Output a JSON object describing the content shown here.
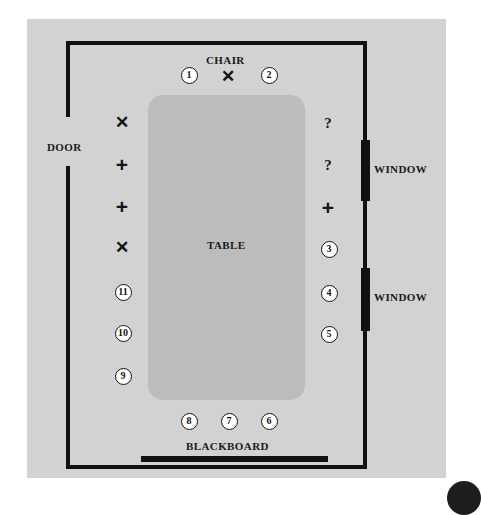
{
  "diagram": {
    "background_color": "#ffffff",
    "panel_color": "#d2d2d2",
    "ink_color": "#111111",
    "table_color": "#bcbcbc"
  },
  "labels": {
    "door": "DOOR",
    "chair": "CHAIR",
    "table": "TABLE",
    "blackboard": "BLACKBOARD",
    "window_top": "WINDOW",
    "window_bottom": "WINDOW"
  },
  "markers": [
    {
      "name": "seat-1",
      "text": "1",
      "kind": "number",
      "x": 188,
      "y": 74
    },
    {
      "name": "chair-x",
      "text": "✕",
      "kind": "x",
      "x": 228,
      "y": 76
    },
    {
      "name": "seat-2",
      "text": "2",
      "kind": "number",
      "x": 268,
      "y": 74
    },
    {
      "name": "left-mark-x-1",
      "text": "✕",
      "kind": "x",
      "x": 122,
      "y": 122
    },
    {
      "name": "left-mark-plus-1",
      "text": "+",
      "kind": "plus",
      "x": 122,
      "y": 164
    },
    {
      "name": "left-mark-plus-2",
      "text": "+",
      "kind": "plus",
      "x": 122,
      "y": 206
    },
    {
      "name": "left-mark-x-2",
      "text": "✕",
      "kind": "x",
      "x": 122,
      "y": 247
    },
    {
      "name": "seat-11",
      "text": "11",
      "kind": "number",
      "x": 122,
      "y": 291
    },
    {
      "name": "seat-10",
      "text": "10",
      "kind": "number",
      "x": 122,
      "y": 332
    },
    {
      "name": "seat-9",
      "text": "9",
      "kind": "number",
      "x": 122,
      "y": 375
    },
    {
      "name": "right-mark-q-1",
      "text": "?",
      "kind": "question",
      "x": 328,
      "y": 123
    },
    {
      "name": "right-mark-q-2",
      "text": "?",
      "kind": "question",
      "x": 328,
      "y": 165
    },
    {
      "name": "right-mark-plus-1",
      "text": "+",
      "kind": "plus",
      "x": 328,
      "y": 207
    },
    {
      "name": "seat-3",
      "text": "3",
      "kind": "number",
      "x": 328,
      "y": 248
    },
    {
      "name": "seat-4",
      "text": "4",
      "kind": "number",
      "x": 328,
      "y": 292
    },
    {
      "name": "seat-5",
      "text": "5",
      "kind": "number",
      "x": 328,
      "y": 333
    },
    {
      "name": "seat-8",
      "text": "8",
      "kind": "number",
      "x": 188,
      "y": 420
    },
    {
      "name": "seat-7",
      "text": "7",
      "kind": "number",
      "x": 228,
      "y": 420
    },
    {
      "name": "seat-6",
      "text": "6",
      "kind": "number",
      "x": 268,
      "y": 420
    }
  ]
}
